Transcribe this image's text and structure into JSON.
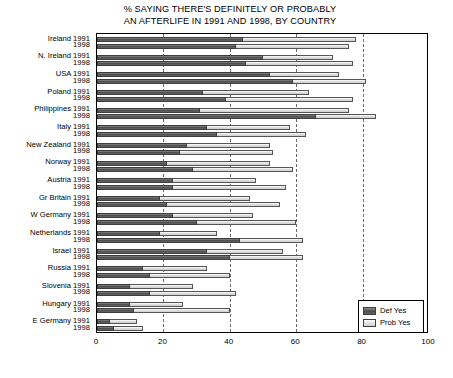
{
  "chart_data": {
    "type": "bar",
    "orientation": "horizontal",
    "stacked": true,
    "title": "% SAYING THERE'S DEFINITELY OR PROBABLY AN AFTERLIFE IN 1991 AND 1998, BY COUNTRY",
    "title_lines": [
      "% SAYING THERE'S DEFINITELY OR PROBABLY",
      "AN AFTERLIFE IN 1991 AND 1998, BY COUNTRY"
    ],
    "xlabel": "",
    "ylabel": "",
    "xlim": [
      0,
      100
    ],
    "xticks": [
      0,
      20,
      40,
      60,
      80,
      100
    ],
    "xtick_labels": [
      "0",
      "20",
      "40",
      "60",
      "80",
      "100"
    ],
    "grid": "vertical-dashed",
    "legend_position": "bottom-right",
    "legend": [
      "Def Yes",
      "Prob Yes"
    ],
    "series": [
      {
        "name": "Def Yes",
        "color": "#5a5a5a"
      },
      {
        "name": "Prob Yes",
        "color": "#dcdcdc"
      }
    ],
    "categories": [
      "Ireland 1991",
      "1998",
      "N. Ireland 1991",
      "1998",
      "USA 1991",
      "1998",
      "Poland 1991",
      "1998",
      "Philippines 1991",
      "1998",
      "Italy 1991",
      "1998",
      "New Zealand 1991",
      "1998",
      "Norway 1991",
      "1998",
      "Austria 1991",
      "1998",
      "Gr Britain 1991",
      "1998",
      "W Germany 1991",
      "1998",
      "Netherlands 1991",
      "1998",
      "Israel 1991",
      "1998",
      "Russia 1991",
      "1998",
      "Slovenia 1991",
      "1998",
      "Hungary 1991",
      "1998",
      "E Germany 1991",
      "1998"
    ],
    "rows": [
      {
        "country": "Ireland",
        "year": "1991",
        "def_yes": 44,
        "prob_yes": 34,
        "total": 78
      },
      {
        "country": "Ireland",
        "year": "1998",
        "def_yes": 42,
        "prob_yes": 34,
        "total": 76
      },
      {
        "country": "N. Ireland",
        "year": "1991",
        "def_yes": 50,
        "prob_yes": 21,
        "total": 71
      },
      {
        "country": "N. Ireland",
        "year": "1998",
        "def_yes": 45,
        "prob_yes": 32,
        "total": 77
      },
      {
        "country": "USA",
        "year": "1991",
        "def_yes": 52,
        "prob_yes": 21,
        "total": 73
      },
      {
        "country": "USA",
        "year": "1998",
        "def_yes": 59,
        "prob_yes": 22,
        "total": 81
      },
      {
        "country": "Poland",
        "year": "1991",
        "def_yes": 32,
        "prob_yes": 32,
        "total": 64
      },
      {
        "country": "Poland",
        "year": "1998",
        "def_yes": 39,
        "prob_yes": 38,
        "total": 77
      },
      {
        "country": "Philippines",
        "year": "1991",
        "def_yes": 31,
        "prob_yes": 45,
        "total": 76
      },
      {
        "country": "Philippines",
        "year": "1998",
        "def_yes": 66,
        "prob_yes": 18,
        "total": 84
      },
      {
        "country": "Italy",
        "year": "1991",
        "def_yes": 33,
        "prob_yes": 25,
        "total": 58
      },
      {
        "country": "Italy",
        "year": "1998",
        "def_yes": 36,
        "prob_yes": 27,
        "total": 63
      },
      {
        "country": "New Zealand",
        "year": "1991",
        "def_yes": 27,
        "prob_yes": 25,
        "total": 52
      },
      {
        "country": "New Zealand",
        "year": "1998",
        "def_yes": 25,
        "prob_yes": 28,
        "total": 53
      },
      {
        "country": "Norway",
        "year": "1991",
        "def_yes": 21,
        "prob_yes": 31,
        "total": 52
      },
      {
        "country": "Norway",
        "year": "1998",
        "def_yes": 29,
        "prob_yes": 30,
        "total": 59
      },
      {
        "country": "Austria",
        "year": "1991",
        "def_yes": 23,
        "prob_yes": 25,
        "total": 48
      },
      {
        "country": "Austria",
        "year": "1998",
        "def_yes": 23,
        "prob_yes": 34,
        "total": 57
      },
      {
        "country": "Gr Britain",
        "year": "1991",
        "def_yes": 19,
        "prob_yes": 27,
        "total": 46
      },
      {
        "country": "Gr Britain",
        "year": "1998",
        "def_yes": 21,
        "prob_yes": 34,
        "total": 55
      },
      {
        "country": "W Germany",
        "year": "1991",
        "def_yes": 23,
        "prob_yes": 24,
        "total": 47
      },
      {
        "country": "W Germany",
        "year": "1998",
        "def_yes": 30,
        "prob_yes": 30,
        "total": 60
      },
      {
        "country": "Netherlands",
        "year": "1991",
        "def_yes": 19,
        "prob_yes": 17,
        "total": 36
      },
      {
        "country": "Netherlands",
        "year": "1998",
        "def_yes": 43,
        "prob_yes": 19,
        "total": 62
      },
      {
        "country": "Israel",
        "year": "1991",
        "def_yes": 33,
        "prob_yes": 23,
        "total": 56
      },
      {
        "country": "Israel",
        "year": "1998",
        "def_yes": 40,
        "prob_yes": 22,
        "total": 62
      },
      {
        "country": "Russia",
        "year": "1991",
        "def_yes": 14,
        "prob_yes": 19,
        "total": 33
      },
      {
        "country": "Russia",
        "year": "1998",
        "def_yes": 16,
        "prob_yes": 24,
        "total": 40
      },
      {
        "country": "Slovenia",
        "year": "1991",
        "def_yes": 10,
        "prob_yes": 19,
        "total": 29
      },
      {
        "country": "Slovenia",
        "year": "1998",
        "def_yes": 16,
        "prob_yes": 26,
        "total": 42
      },
      {
        "country": "Hungary",
        "year": "1991",
        "def_yes": 10,
        "prob_yes": 16,
        "total": 26
      },
      {
        "country": "Hungary",
        "year": "1998",
        "def_yes": 11,
        "prob_yes": 29,
        "total": 40
      },
      {
        "country": "E Germany",
        "year": "1991",
        "def_yes": 4,
        "prob_yes": 8,
        "total": 12
      },
      {
        "country": "E Germany",
        "year": "1998",
        "def_yes": 5,
        "prob_yes": 9,
        "total": 14
      }
    ]
  },
  "caption": {
    "text": ""
  }
}
